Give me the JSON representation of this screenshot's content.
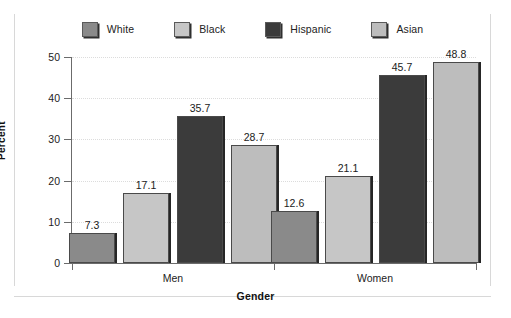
{
  "chart_data": {
    "type": "bar",
    "title": "",
    "xlabel": "Gender",
    "ylabel": "Percent",
    "categories": [
      "Men",
      "Women"
    ],
    "series": [
      {
        "name": "White",
        "values": [
          7.3,
          12.6
        ],
        "color": "#8a8a8a"
      },
      {
        "name": "Black",
        "values": [
          17.1,
          21.1
        ],
        "color": "#c6c6c6"
      },
      {
        "name": "Hispanic",
        "values": [
          35.7,
          45.7
        ],
        "color": "#3b3b3b"
      },
      {
        "name": "Asian",
        "values": [
          28.7,
          48.8
        ],
        "color": "#bdbdbd"
      }
    ],
    "ylim": [
      0,
      50
    ],
    "yticks": [
      0,
      10,
      20,
      30,
      40,
      50
    ],
    "ytick_labels": [
      "0",
      "10",
      "20",
      "30",
      "40",
      "50"
    ],
    "grid": true,
    "grid_axis": "y",
    "legend_position": "top",
    "data_labels": [
      "7.3",
      "17.1",
      "35.7",
      "28.7",
      "12.6",
      "21.1",
      "45.7",
      "48.8"
    ]
  },
  "axes": {
    "y_title": "Percent",
    "x_title": "Gender"
  },
  "legend": {
    "items": [
      {
        "label": "White"
      },
      {
        "label": "Black"
      },
      {
        "label": "Hispanic"
      },
      {
        "label": "Asian"
      }
    ]
  },
  "groups": [
    {
      "label": "Men"
    },
    {
      "label": "Women"
    }
  ]
}
